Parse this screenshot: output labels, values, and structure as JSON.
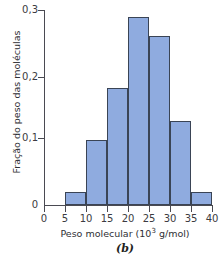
{
  "chart_data": {
    "type": "bar",
    "title": "",
    "subtitle": "",
    "caption": "(b)",
    "xlabel_prefix": "Peso molecular (10",
    "xlabel_exponent": "3",
    "xlabel_suffix": " g/mol)",
    "xlabel": "Peso molecular (10³ g/mol)",
    "ylabel": "Fração do peso das moléculas",
    "categories": [
      "5-10",
      "10-15",
      "15-20",
      "20-25",
      "25-30",
      "30-35",
      "35-40"
    ],
    "bin_edges": [
      5,
      10,
      15,
      20,
      25,
      30,
      35,
      40
    ],
    "values": [
      0.02,
      0.1,
      0.18,
      0.29,
      0.26,
      0.13,
      0.02
    ],
    "bars": [
      {
        "x_start": 5,
        "x_end": 10,
        "value": 0.02
      },
      {
        "x_start": 10,
        "x_end": 15,
        "value": 0.1
      },
      {
        "x_start": 15,
        "x_end": 20,
        "value": 0.18
      },
      {
        "x_start": 20,
        "x_end": 25,
        "value": 0.29
      },
      {
        "x_start": 25,
        "x_end": 30,
        "value": 0.26
      },
      {
        "x_start": 30,
        "x_end": 35,
        "value": 0.13
      },
      {
        "x_start": 35,
        "x_end": 40,
        "value": 0.02
      }
    ],
    "xlim": [
      0,
      40
    ],
    "ylim": [
      0,
      0.3
    ],
    "xticks": [
      0,
      5,
      10,
      15,
      20,
      25,
      30,
      35,
      40
    ],
    "xtick_labels": [
      "0",
      "5",
      "10",
      "15",
      "20",
      "25",
      "30",
      "35",
      "40"
    ],
    "yticks": [
      0,
      0.1,
      0.2,
      0.3
    ],
    "ytick_labels": [
      "0",
      "0,1",
      "0,2",
      "0,3"
    ],
    "grid": false,
    "legend": false,
    "legend_position": "none",
    "bar_fill_color": "#8fabdf",
    "bar_border_color": "#3a4455",
    "axis_color": "#4a4a52",
    "background_color": "#ffffff"
  }
}
